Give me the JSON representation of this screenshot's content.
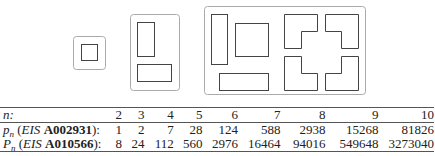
{
  "figure": {
    "groups": [
      {
        "n": 2,
        "shapes": [
          "square"
        ]
      },
      {
        "n": 3,
        "shapes": [
          "vertical-rectangle",
          "horizontal-rectangle"
        ]
      },
      {
        "n": 4,
        "shapes": [
          "vertical-rectangle",
          "square",
          "horizontal-rectangle",
          "L-tromino-1",
          "L-tromino-2",
          "L-tromino-3",
          "L-tromino-4"
        ]
      }
    ]
  },
  "table": {
    "header_label": "n:",
    "columns": [
      "2",
      "3",
      "4",
      "5",
      "6",
      "7",
      "8",
      "9",
      "10"
    ],
    "rows": [
      {
        "sym": "p",
        "sub": "n",
        "src": "EIS",
        "id": "A002931",
        "values": [
          "1",
          "2",
          "7",
          "28",
          "124",
          "588",
          "2938",
          "15268",
          "81826"
        ]
      },
      {
        "sym": "P",
        "sub": "n",
        "src": "EIS",
        "id": "A010566",
        "values": [
          "8",
          "24",
          "112",
          "560",
          "2976",
          "16464",
          "94016",
          "549648",
          "3273040"
        ]
      }
    ]
  }
}
